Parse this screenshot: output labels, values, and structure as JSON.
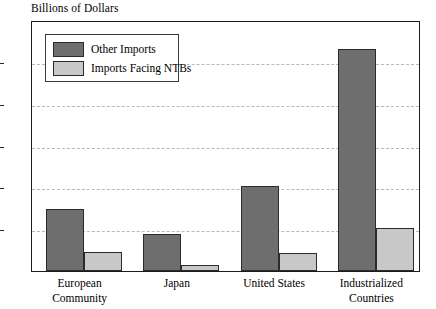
{
  "chart_data": {
    "type": "bar",
    "title": "Billions of Dollars",
    "xlabel": "",
    "ylabel": "",
    "ylim": [
      0,
      300
    ],
    "yticks": [
      0,
      50,
      100,
      150,
      200,
      250,
      300
    ],
    "ytick_labels": [
      "0",
      "50",
      "100",
      "150",
      "200",
      "250",
      "300"
    ],
    "grid": true,
    "legend_position": "upper-left-inside",
    "categories": [
      "European Community",
      "Japan",
      "United States",
      "Industrialized Countries"
    ],
    "category_lines": [
      [
        "European",
        "Community"
      ],
      [
        "Japan"
      ],
      [
        "United States"
      ],
      [
        "Industrialized",
        "Countries"
      ]
    ],
    "series": [
      {
        "name": "Other Imports",
        "color": "#6e6e6e",
        "values": [
          74,
          44,
          102,
          265
        ]
      },
      {
        "name": "Imports Facing NTBs",
        "color": "#c8c8c8",
        "values": [
          23,
          7,
          22,
          52
        ]
      }
    ]
  },
  "legend": {
    "items": [
      {
        "label": "Other Imports",
        "color": "#6e6e6e"
      },
      {
        "label": "Imports Facing NTBs",
        "color": "#c8c8c8"
      }
    ]
  },
  "colors": {
    "other_imports": "#6e6e6e",
    "imports_facing_ntbs": "#c8c8c8",
    "axis": "#1b1b1b",
    "gridline": "#b9b9b9",
    "background": "#ffffff"
  }
}
